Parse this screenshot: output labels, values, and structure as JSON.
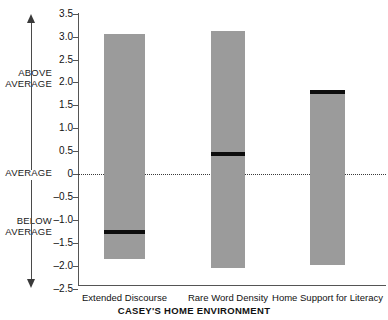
{
  "chart_data": {
    "type": "bar",
    "title": "",
    "xlabel": "CASEY'S HOME ENVIRONMENT",
    "ylabel": "",
    "ylim": [
      -2.5,
      3.5
    ],
    "grid": false,
    "legend": "none",
    "yticks": [
      "3.5",
      "3.0",
      "2.5",
      "2.0",
      "1.5",
      "1.0",
      "0.5",
      "0",
      "–0.5",
      "–1.0",
      "–1.5",
      "–2.0",
      "–2.5"
    ],
    "ytick_values": [
      3.5,
      3.0,
      2.5,
      2.0,
      1.5,
      1.0,
      0.5,
      0,
      -0.5,
      -1.0,
      -1.5,
      -2.0,
      -2.5
    ],
    "zero_reference": 0,
    "categories": [
      "Extended Discourse",
      "Rare Word Density",
      "Home Support for Literacy"
    ],
    "series": [
      {
        "name": "confidence band",
        "type": "range",
        "low": [
          -1.85,
          -2.05,
          -1.98
        ],
        "high": [
          3.05,
          3.12,
          1.83
        ]
      },
      {
        "name": "score marker",
        "type": "marker",
        "values": [
          -1.27,
          0.44,
          1.83
        ]
      }
    ],
    "annotations": [
      {
        "label": "ABOVE\nAVERAGE",
        "at": 2.0,
        "direction": "up"
      },
      {
        "label": "AVERAGE",
        "at": 0,
        "direction": "none"
      },
      {
        "label": "BELOW\nAVERAGE",
        "at": -1.2,
        "direction": "down"
      }
    ],
    "colors": {
      "band": "#9b9b9b",
      "marker": "#0d0d0d",
      "axis": "#555555",
      "zero_line": "#3a3a3a",
      "text": "#111111"
    }
  },
  "annotations": {
    "above": "ABOVE\nAVERAGE",
    "average": "AVERAGE",
    "below": "BELOW\nAVERAGE"
  }
}
